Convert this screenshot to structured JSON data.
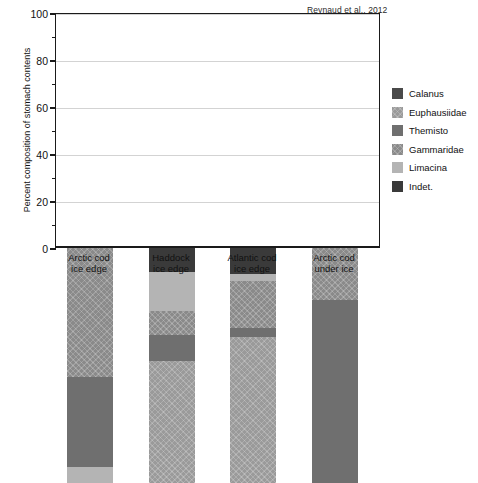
{
  "citation": "Reynaud et al., 2012",
  "chart_data": {
    "type": "bar",
    "subtype": "stacked-percent",
    "title": "",
    "xlabel": "",
    "ylabel": "Percent composition of stomach contents",
    "ylim": [
      0,
      100
    ],
    "yticks": [
      0,
      20,
      40,
      60,
      80,
      100
    ],
    "yticklabels": [
      "0",
      "20",
      "40",
      "60",
      "80",
      "100"
    ],
    "minor_yticks": [
      10,
      30,
      50,
      70,
      90
    ],
    "grid": "horizontal",
    "legend_position": "right",
    "categories": [
      "Arctic cod\nice edge",
      "Haddock\nice edge",
      "Atlantic cod\nice edge",
      "Arctic cod\nunder ice"
    ],
    "category_lines": [
      [
        "Arctic cod",
        "ice edge"
      ],
      [
        "Haddock",
        "ice edge"
      ],
      [
        "Atlantic cod",
        "ice edge"
      ],
      [
        "Arctic cod",
        "under ice"
      ]
    ],
    "series": [
      {
        "name": "Calanus",
        "color": "#4a4a4a",
        "hatch": false,
        "values": [
          0,
          0,
          0,
          0
        ]
      },
      {
        "name": "Euphausiidae",
        "color": "#9a9a9a",
        "hatch": true,
        "values": [
          0,
          52,
          62,
          0
        ]
      },
      {
        "name": "Themisto",
        "color": "#6f6f6f",
        "hatch": false,
        "values": [
          38,
          11,
          4,
          78
        ]
      },
      {
        "name": "Gammaridae",
        "color": "#8a8a8a",
        "hatch": true,
        "values": [
          55,
          10,
          20,
          22
        ]
      },
      {
        "name": "Limacina",
        "color": "#b4b4b4",
        "hatch": false,
        "values": [
          7,
          17,
          3,
          0
        ]
      },
      {
        "name": "Indet.",
        "color": "#3a3a3a",
        "hatch": false,
        "values": [
          0,
          10,
          11,
          0
        ]
      }
    ],
    "stack_order_bottom_to_top": [
      "Calanus",
      "Euphausiidae",
      "Themisto",
      "Gammaridae",
      "Limacina",
      "Indet."
    ],
    "bars": [
      {
        "category": "Arctic cod ice edge",
        "segments": [
          {
            "name": "Limacina",
            "from": 0,
            "to": 7
          },
          {
            "name": "Themisto",
            "from": 7,
            "to": 45
          },
          {
            "name": "Gammaridae",
            "from": 45,
            "to": 100
          }
        ]
      },
      {
        "category": "Haddock ice edge",
        "segments": [
          {
            "name": "Euphausiidae",
            "from": 0,
            "to": 52
          },
          {
            "name": "Themisto",
            "from": 52,
            "to": 63
          },
          {
            "name": "Gammaridae",
            "from": 63,
            "to": 73
          },
          {
            "name": "Limacina",
            "from": 73,
            "to": 90
          },
          {
            "name": "Indet.",
            "from": 90,
            "to": 100
          }
        ]
      },
      {
        "category": "Atlantic cod ice edge",
        "segments": [
          {
            "name": "Euphausiidae",
            "from": 0,
            "to": 62
          },
          {
            "name": "Themisto",
            "from": 62,
            "to": 66
          },
          {
            "name": "Gammaridae",
            "from": 66,
            "to": 86
          },
          {
            "name": "Limacina",
            "from": 86,
            "to": 89
          },
          {
            "name": "Indet.",
            "from": 89,
            "to": 100
          }
        ]
      },
      {
        "category": "Arctic cod under ice",
        "segments": [
          {
            "name": "Themisto",
            "from": 0,
            "to": 78
          },
          {
            "name": "Gammaridae",
            "from": 78,
            "to": 100
          }
        ]
      }
    ]
  },
  "legend": {
    "items": [
      {
        "label": "Calanus",
        "color": "#4a4a4a",
        "hatch": false
      },
      {
        "label": "Euphausiidae",
        "color": "#9a9a9a",
        "hatch": true
      },
      {
        "label": "Themisto",
        "color": "#6f6f6f",
        "hatch": false
      },
      {
        "label": "Gammaridae",
        "color": "#8a8a8a",
        "hatch": true
      },
      {
        "label": "Limacina",
        "color": "#b4b4b4",
        "hatch": false
      },
      {
        "label": "Indet.",
        "color": "#3a3a3a",
        "hatch": false
      }
    ]
  }
}
